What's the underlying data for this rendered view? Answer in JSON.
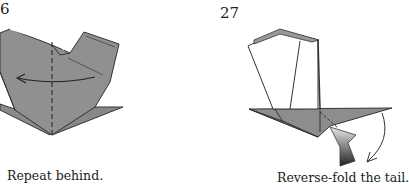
{
  "steps": [
    {
      "number": "6",
      "caption": "Repeat behind."
    },
    {
      "number": "27",
      "caption": "Reverse-fold the tail."
    }
  ],
  "colors": {
    "paper": "#8f8f8f",
    "paper_dark": "#7a7a7a",
    "line": "#333333",
    "background": "#ffffff"
  }
}
